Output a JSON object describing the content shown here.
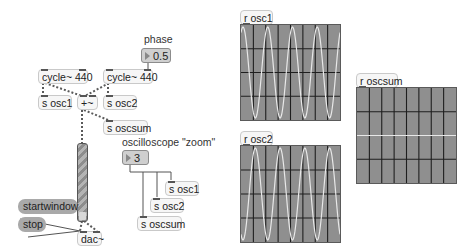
{
  "patch": {
    "labels": {
      "phase": "phase",
      "oscilloscope_zoom": "oscilloscope \"zoom\""
    },
    "objects": {
      "cycle1": "cycle~ 440",
      "cycle2": "cycle~ 440",
      "send_osc1": "s osc1",
      "send_osc2": "s osc2",
      "plus": "+~",
      "send_oscsum": "s oscsum",
      "dac": "dac~",
      "zoom_send_osc1": "s osc1",
      "zoom_send_osc2": "s osc2",
      "zoom_send_oscsum": "s oscsum",
      "recv_osc1": "r osc1",
      "recv_osc2": "r osc2",
      "recv_oscsum": "r oscsum"
    },
    "number_boxes": {
      "phase_value": "0.5",
      "zoom_value": "3"
    },
    "messages": {
      "startwindow": "startwindow",
      "stop": "stop"
    },
    "gain_slider": {
      "level_percent": 5
    },
    "scopes": {
      "osc1": {
        "signal": "sine",
        "cycles_visible": 4,
        "phase": 0.0
      },
      "osc2": {
        "signal": "sine",
        "cycles_visible": 4,
        "phase": 0.5
      },
      "oscsum": {
        "signal": "flat (cancellation)",
        "cycles_visible": 0
      }
    },
    "colors": {
      "scope_bg": "#8f8f8f",
      "scope_grid": "#1e1e1e",
      "scope_trace": "#e8e8e8",
      "message_bg": "#a9a9a9",
      "number_bg": "#cfcfcf"
    }
  }
}
